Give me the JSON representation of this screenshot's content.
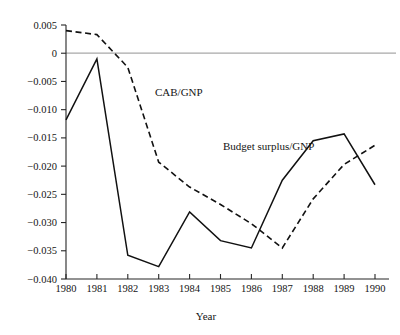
{
  "chart_data": {
    "type": "line",
    "title": "",
    "xlabel": "Year",
    "ylabel": "",
    "grid": false,
    "legend_position": "inline-annotation",
    "x": [
      1980,
      1981,
      1982,
      1983,
      1984,
      1985,
      1986,
      1987,
      1988,
      1989,
      1990
    ],
    "categories": [
      "1980",
      "1981",
      "1982",
      "1983",
      "1984",
      "1985",
      "1986",
      "1987",
      "1988",
      "1989",
      "1990"
    ],
    "xlim": [
      1980,
      1990
    ],
    "ylim": [
      -0.04,
      0.005
    ],
    "ytick_labels": [
      "0.005",
      "0",
      "-0.005",
      "-0.010",
      "-0.015",
      "-0.020",
      "-0.025",
      "-0.030",
      "-0.035",
      "-0.040"
    ],
    "ytick_values": [
      0.005,
      0,
      -0.005,
      -0.01,
      -0.015,
      -0.02,
      -0.025,
      -0.03,
      -0.035,
      -0.04
    ],
    "zero_reference_line": 0,
    "series": [
      {
        "name": "Budget surplus/GNP",
        "style": "solid",
        "color": "#111111",
        "label_text": "Budget surplus/GNP",
        "values": [
          -0.0118,
          -0.001,
          -0.0358,
          -0.0378,
          -0.0281,
          -0.0332,
          -0.0345,
          -0.0225,
          -0.0155,
          -0.0143,
          -0.0233
        ]
      },
      {
        "name": "CAB/GNP",
        "style": "dashed",
        "color": "#111111",
        "label_text": "CAB/GNP",
        "values": [
          0.004,
          0.0033,
          -0.0025,
          -0.0193,
          -0.0237,
          -0.0268,
          -0.0302,
          -0.0345,
          -0.0258,
          -0.0197,
          -0.0163
        ]
      }
    ]
  },
  "annotations": {
    "cab_label": "CAB/GNP",
    "budget_label": "Budget surplus/GNP"
  },
  "axes": {
    "x_title": "Year"
  }
}
